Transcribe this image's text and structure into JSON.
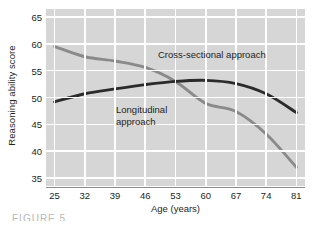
{
  "chart_data": {
    "type": "line",
    "title": "",
    "xlabel": "Age (years)",
    "ylabel": "Reasoning ability score",
    "x": [
      25,
      32,
      39,
      46,
      53,
      60,
      67,
      74,
      81
    ],
    "xlim": [
      23,
      83
    ],
    "ylim": [
      33.5,
      66.5
    ],
    "yticks": [
      65,
      60,
      55,
      50,
      45,
      40,
      35
    ],
    "xticks": [
      25,
      32,
      39,
      46,
      53,
      60,
      67,
      74,
      81
    ],
    "grid": true,
    "legend_position": "inline-annotations",
    "series": [
      {
        "name": "Cross-sectional approach",
        "color": "#8a8a8a",
        "values": [
          59.5,
          57.6,
          56.8,
          55.6,
          53.0,
          48.9,
          47.4,
          43.2,
          37.0
        ]
      },
      {
        "name": "Longitudinal approach",
        "color": "#2b2b2b",
        "values": [
          49.2,
          50.7,
          51.6,
          52.4,
          53.0,
          53.2,
          52.6,
          50.7,
          47.2
        ]
      }
    ],
    "annotations": [
      {
        "text": "Cross-sectional approach",
        "x": 43,
        "y": 60.5
      },
      {
        "text": "Longitudinal\napproach",
        "x": 32,
        "y": 49.5
      }
    ],
    "plot_background": "#d6d6d6",
    "gridline_color": "#ffffff",
    "text_color": "#231f20"
  },
  "caption": {
    "text": "FIGURE 5"
  }
}
